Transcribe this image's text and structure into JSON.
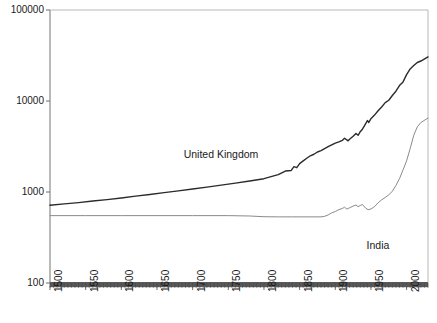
{
  "chart_data": {
    "type": "line",
    "title": "",
    "subtitle": "",
    "xlabel": "",
    "ylabel": "",
    "yscale": "log",
    "xscale": "linear",
    "xlim": [
      1500,
      2030
    ],
    "ylim": [
      100,
      100000
    ],
    "grid": false,
    "legend_position": "inline-annotation",
    "yticks": [
      100,
      1000,
      10000,
      100000
    ],
    "ytick_labels": [
      "100",
      "1000",
      "10000",
      "100000"
    ],
    "xticks": [
      1500,
      1550,
      1600,
      1650,
      1700,
      1750,
      1800,
      1850,
      1900,
      1950,
      2000
    ],
    "xtick_labels": [
      "1500",
      "1550",
      "1600",
      "1650",
      "1700",
      "1750",
      "1800",
      "1850",
      "1900",
      "1950",
      "2000"
    ],
    "annotations": [
      {
        "text": "United Kingdom",
        "x": 1740,
        "y": 2600
      },
      {
        "text": "India",
        "x": 1960,
        "y": 260
      }
    ],
    "series": [
      {
        "name": "United Kingdom",
        "color": "#2b2b2b",
        "width": 1.4,
        "x": [
          1500,
          1520,
          1540,
          1560,
          1580,
          1600,
          1620,
          1640,
          1660,
          1680,
          1700,
          1720,
          1740,
          1760,
          1780,
          1800,
          1820,
          1830,
          1838,
          1842,
          1846,
          1850,
          1855,
          1860,
          1865,
          1870,
          1875,
          1880,
          1885,
          1890,
          1895,
          1900,
          1905,
          1910,
          1913,
          1918,
          1920,
          1925,
          1929,
          1932,
          1935,
          1938,
          1940,
          1943,
          1945,
          1947,
          1950,
          1955,
          1960,
          1965,
          1970,
          1975,
          1980,
          1985,
          1990,
          1995,
          2000,
          2005,
          2010,
          2015,
          2020,
          2030
        ],
        "y": [
          714,
          740,
          765,
          795,
          825,
          860,
          900,
          940,
          985,
          1030,
          1080,
          1130,
          1190,
          1250,
          1320,
          1400,
          1550,
          1700,
          1720,
          1900,
          1850,
          2050,
          2200,
          2350,
          2500,
          2600,
          2750,
          2850,
          3000,
          3150,
          3300,
          3450,
          3550,
          3700,
          3900,
          3650,
          3800,
          4100,
          4400,
          4200,
          4600,
          4900,
          5200,
          5700,
          6100,
          5800,
          6400,
          7000,
          7800,
          8600,
          9600,
          10200,
          11500,
          12800,
          14800,
          16200,
          19500,
          22500,
          24500,
          26500,
          27500,
          30500
        ]
      },
      {
        "name": "India",
        "color": "#8a8a8a",
        "width": 1.0,
        "x": [
          1500,
          1550,
          1600,
          1650,
          1700,
          1750,
          1780,
          1800,
          1820,
          1840,
          1860,
          1870,
          1880,
          1885,
          1890,
          1895,
          1900,
          1905,
          1910,
          1913,
          1916,
          1920,
          1925,
          1929,
          1932,
          1935,
          1938,
          1940,
          1943,
          1946,
          1950,
          1955,
          1960,
          1965,
          1970,
          1975,
          1980,
          1985,
          1990,
          1995,
          2000,
          2005,
          2010,
          2015,
          2020,
          2030
        ],
        "y": [
          550,
          550,
          550,
          550,
          550,
          550,
          545,
          535,
          533,
          533,
          533,
          533,
          533,
          540,
          560,
          590,
          610,
          640,
          660,
          680,
          650,
          670,
          700,
          720,
          690,
          710,
          730,
          700,
          660,
          640,
          650,
          690,
          760,
          820,
          870,
          930,
          1020,
          1180,
          1400,
          1750,
          2200,
          3000,
          4200,
          5200,
          5800,
          6500
        ]
      }
    ]
  }
}
